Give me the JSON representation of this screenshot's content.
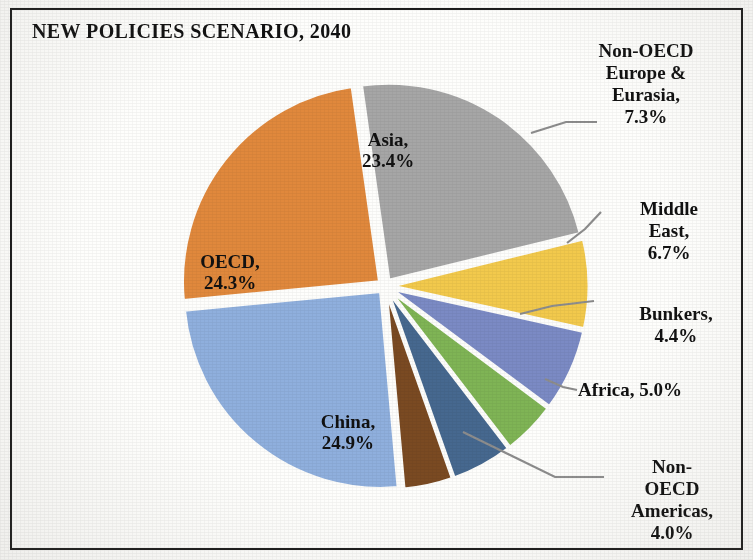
{
  "chart_title": "NEW POLICIES SCENARIO, 2040",
  "labels": {
    "asia": "Asia,\n23.4%",
    "oecd": "OECD,\n24.3%",
    "china": "China,\n24.9%",
    "non_oecd_europe_eurasia": "Non-OECD\nEurope &\nEurasia,\n7.3%",
    "middle_east": "Middle East,\n6.7%",
    "bunkers": "Bunkers,\n4.4%",
    "africa": "Africa, 5.0%",
    "non_oecd_americas": "Non-OECD\nAmericas,\n4.0%"
  },
  "chart_data": {
    "type": "pie",
    "title": "NEW POLICIES SCENARIO, 2040",
    "xlabel": "",
    "ylabel": "",
    "legend_position": "none",
    "grid": false,
    "value_unit": "percent",
    "labels_show_percent": true,
    "categories": [
      "Asia",
      "Non-OECD Europe & Eurasia",
      "Middle East",
      "Bunkers",
      "Africa",
      "Non-OECD Americas",
      "China",
      "OECD"
    ],
    "values": [
      23.4,
      7.3,
      6.7,
      4.4,
      5.0,
      4.0,
      24.9,
      24.3
    ],
    "colors": [
      "#a6a6a6",
      "#f2c94c",
      "#7b8ac4",
      "#7fb455",
      "#46688f",
      "#7a4a22",
      "#8fafdd",
      "#e0883c"
    ],
    "slices": [
      {
        "name": "Asia",
        "value": 23.4,
        "color": "#a6a6a6",
        "label_placement": "inside"
      },
      {
        "name": "Non-OECD Europe & Eurasia",
        "value": 7.3,
        "color": "#f2c94c",
        "label_placement": "outside"
      },
      {
        "name": "Middle East",
        "value": 6.7,
        "color": "#7b8ac4",
        "label_placement": "outside"
      },
      {
        "name": "Bunkers",
        "value": 4.4,
        "color": "#7fb455",
        "label_placement": "outside"
      },
      {
        "name": "Africa",
        "value": 5.0,
        "color": "#46688f",
        "label_placement": "outside"
      },
      {
        "name": "Non-OECD Americas",
        "value": 4.0,
        "color": "#7a4a22",
        "label_placement": "outside"
      },
      {
        "name": "China",
        "value": 24.9,
        "color": "#8fafdd",
        "label_placement": "inside"
      },
      {
        "name": "OECD",
        "value": 24.3,
        "color": "#e0883c",
        "label_placement": "inside"
      }
    ],
    "total": 100.0
  }
}
